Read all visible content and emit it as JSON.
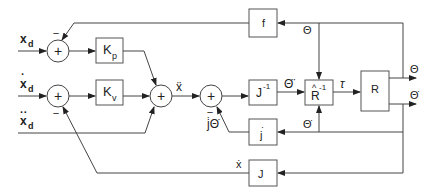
{
  "diagram": {
    "type": "control-block-diagram",
    "inputs": [
      {
        "id": "xd",
        "label": "x",
        "sub": "d",
        "accent": ""
      },
      {
        "id": "xd_dot",
        "label": "x",
        "sub": "d",
        "accent": "·"
      },
      {
        "id": "xd_ddot",
        "label": "x",
        "sub": "d",
        "accent": "··"
      }
    ],
    "blocks": [
      {
        "id": "Kp",
        "label": "K",
        "sub": "p"
      },
      {
        "id": "Kv",
        "label": "K",
        "sub": "v"
      },
      {
        "id": "Jinv",
        "label": "J",
        "sup": "-1"
      },
      {
        "id": "Rhatinv",
        "label": "R",
        "sup": "-1",
        "hat": "^"
      },
      {
        "id": "R",
        "label": "R"
      },
      {
        "id": "f",
        "label": "f"
      },
      {
        "id": "jdot",
        "label": "j",
        "accent": "·"
      },
      {
        "id": "J",
        "label": "J"
      }
    ],
    "summing_junctions": [
      {
        "id": "s1",
        "symbol": "+",
        "minus_label": "−"
      },
      {
        "id": "s2",
        "symbol": "+",
        "minus_label": "−"
      },
      {
        "id": "s3",
        "symbol": "+"
      },
      {
        "id": "s4",
        "symbol": "+",
        "minus_label": "−"
      }
    ],
    "signal_labels": {
      "x_ddot": "ẍ",
      "theta_ddot": "Θ̈",
      "tau": "τ",
      "theta_out": "Θ",
      "theta_dot_out": "Θ̇",
      "theta_fb": "Θ",
      "theta_dot_fb": "Θ̇",
      "jdot_thetadot": "j̇Θ̇",
      "x_dot": "ẋ"
    },
    "minus": "−",
    "plus": "+"
  }
}
